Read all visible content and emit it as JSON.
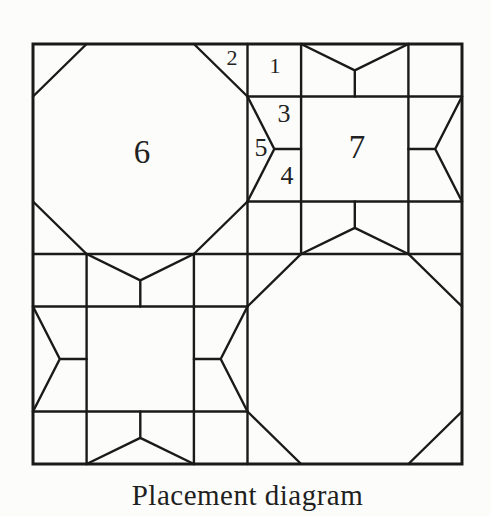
{
  "caption": "Placement diagram",
  "piece_labels": [
    {
      "piece": "1",
      "text": "1"
    },
    {
      "piece": "2",
      "text": "2"
    },
    {
      "piece": "3",
      "text": "3"
    },
    {
      "piece": "4",
      "text": "4"
    },
    {
      "piece": "5",
      "text": "5"
    },
    {
      "piece": "6",
      "text": "6"
    },
    {
      "piece": "7",
      "text": "7"
    }
  ],
  "colors": {
    "line": "#1a1a1a",
    "background": "#fcfcfa",
    "label_text": "#222222"
  }
}
